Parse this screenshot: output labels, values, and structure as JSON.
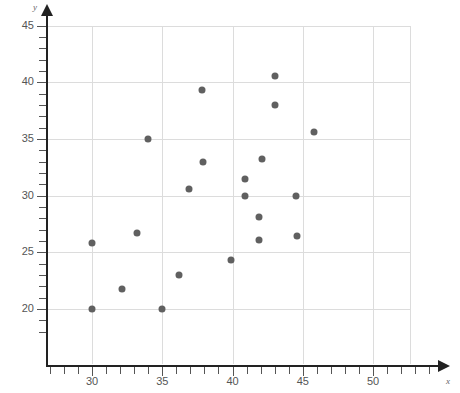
{
  "chart_data": {
    "type": "scatter",
    "title": "",
    "xlabel": "x",
    "ylabel": "y",
    "xlim": [
      26,
      54
    ],
    "ylim": [
      17.5,
      45
    ],
    "grid": true,
    "legend": null,
    "x_ticks_major": [
      30,
      35,
      40,
      45,
      50
    ],
    "y_ticks_major": [
      20,
      25,
      30,
      35,
      40,
      45
    ],
    "x_tick_labels": [
      "30",
      "35",
      "40",
      "45",
      "50"
    ],
    "y_tick_labels": [
      "20",
      "25",
      "30",
      "35",
      "40",
      "45"
    ],
    "x_minor_step": 1,
    "y_minor_step": 1,
    "point_color": "#606060",
    "grid_color": "#dcdcdc",
    "axis_color": "#222222",
    "points": [
      {
        "x": 30.0,
        "y": 25.8
      },
      {
        "x": 30.0,
        "y": 20.0
      },
      {
        "x": 32.1,
        "y": 21.8
      },
      {
        "x": 33.2,
        "y": 26.7
      },
      {
        "x": 34.0,
        "y": 35.0
      },
      {
        "x": 35.0,
        "y": 20.0
      },
      {
        "x": 36.2,
        "y": 23.0
      },
      {
        "x": 36.9,
        "y": 30.6
      },
      {
        "x": 37.8,
        "y": 39.3
      },
      {
        "x": 37.9,
        "y": 33.0
      },
      {
        "x": 39.9,
        "y": 24.3
      },
      {
        "x": 40.9,
        "y": 31.5
      },
      {
        "x": 40.9,
        "y": 30.0
      },
      {
        "x": 41.9,
        "y": 28.1
      },
      {
        "x": 41.9,
        "y": 26.1
      },
      {
        "x": 42.1,
        "y": 33.2
      },
      {
        "x": 43.0,
        "y": 40.6
      },
      {
        "x": 43.0,
        "y": 38.0
      },
      {
        "x": 44.5,
        "y": 30.0
      },
      {
        "x": 44.6,
        "y": 26.4
      },
      {
        "x": 45.8,
        "y": 35.6
      }
    ]
  },
  "axes": {
    "y_axis_name": "y",
    "x_axis_name": "x"
  }
}
